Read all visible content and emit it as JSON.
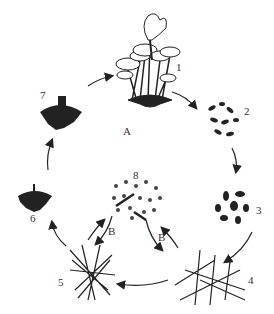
{
  "diagram": {
    "labels": {
      "stage1": "1",
      "stage2": "2",
      "stage3": "3",
      "stage4": "4",
      "stage5": "5",
      "stage6": "6",
      "stage7": "7",
      "stage8": "8",
      "cycleA": "A",
      "pathB_left": "B",
      "pathB_right": "B"
    },
    "stages": [
      {
        "id": "1",
        "depiction": "cluster of mature mushrooms (fruiting bodies)"
      },
      {
        "id": "2",
        "depiction": "scattered spores"
      },
      {
        "id": "3",
        "depiction": "germinating spores"
      },
      {
        "id": "4",
        "depiction": "primary mycelium"
      },
      {
        "id": "5",
        "depiction": "secondary mycelium"
      },
      {
        "id": "6",
        "depiction": "mycelial knot / primordium"
      },
      {
        "id": "7",
        "depiction": "young fruiting body with rhizomorphs"
      },
      {
        "id": "8",
        "depiction": "asexual spores / fragments"
      }
    ],
    "colors": {
      "ink": "#222222",
      "background": "#ffffff"
    }
  }
}
